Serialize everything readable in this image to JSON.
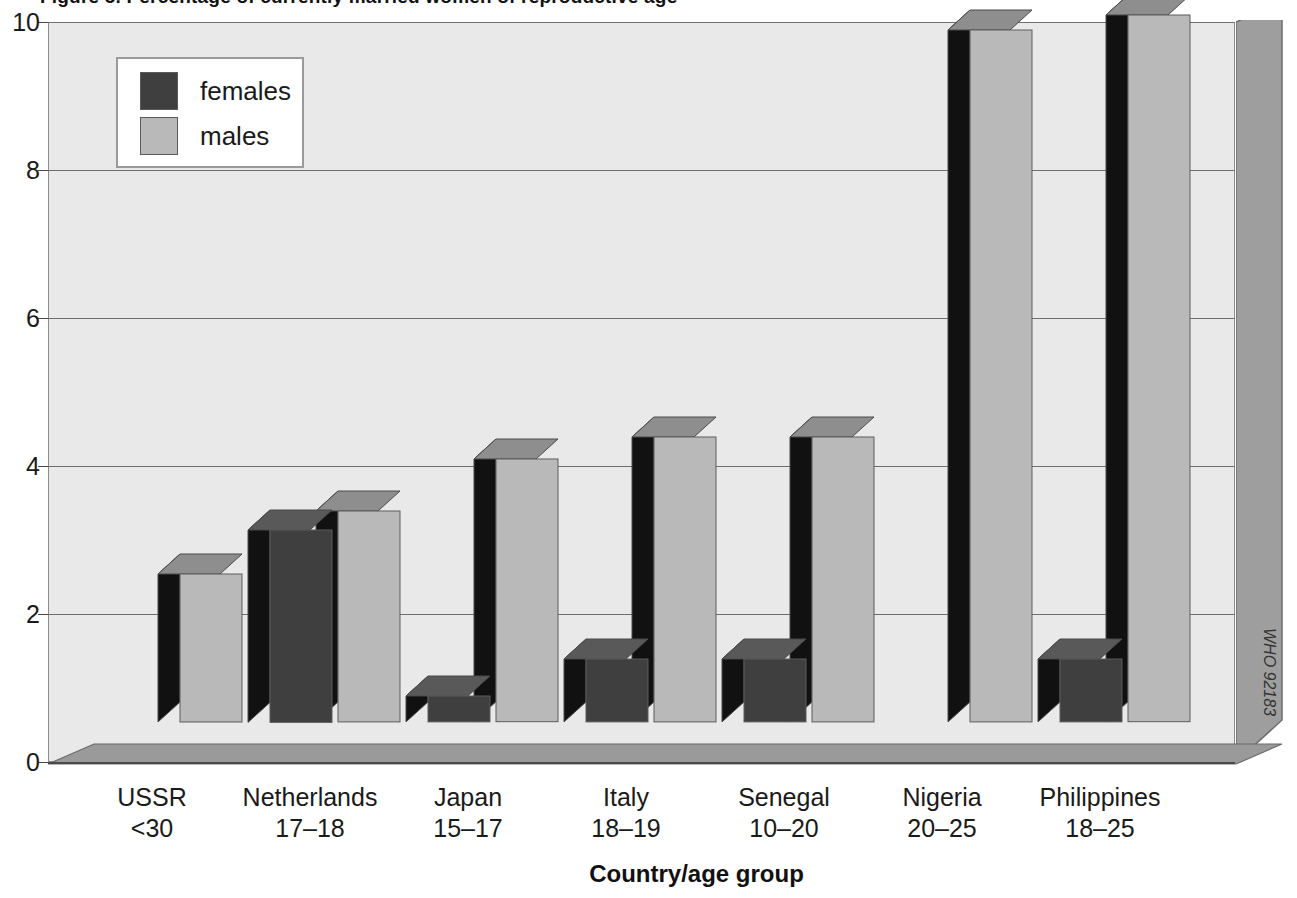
{
  "title_cut": "Figure 5. Percentage of currently married women of reproductive age",
  "credit": "WHO 92183",
  "legend": {
    "position": "top-left",
    "entries": [
      {
        "label": "females",
        "color": "#3f3f3f",
        "key": "females"
      },
      {
        "label": "males",
        "color": "#b9b9b9",
        "key": "males"
      }
    ]
  },
  "chart_data": {
    "type": "bar",
    "title": "",
    "xlabel": "Country/age group",
    "ylabel": "",
    "ylim": [
      0,
      10
    ],
    "yticks": [
      0,
      2,
      4,
      6,
      8,
      10
    ],
    "ytick_labels": [
      "0",
      "2",
      "4",
      "6",
      "8",
      "10"
    ],
    "grid": true,
    "legend_position": "top-left",
    "style": "3d-clustered-bar",
    "categories": [
      "USSR\n<30",
      "Netherlands\n17–18",
      "Japan\n15–17",
      "Italy\n18–19",
      "Senegal\n10–20",
      "Nigeria\n20–25",
      "Philippines\n18–25"
    ],
    "category_country": [
      "USSR",
      "Netherlands",
      "Japan",
      "Italy",
      "Senegal",
      "Nigeria",
      "Philippines"
    ],
    "category_age": [
      "<30",
      "17–18",
      "15–17",
      "18–19",
      "10–20",
      "20–25",
      "18–25"
    ],
    "series": [
      {
        "name": "females",
        "color": "#3f3f3f",
        "values": [
          0,
          2.6,
          0.35,
          0.85,
          0.85,
          0,
          0.85
        ]
      },
      {
        "name": "males",
        "color": "#b9b9b9",
        "values": [
          2.0,
          2.85,
          3.55,
          3.85,
          3.85,
          9.35,
          9.55
        ]
      }
    ]
  },
  "colors": {
    "plot_background": "#e9e9e9",
    "page_background": "#ffffff",
    "female_bar": "#3f3f3f",
    "female_bar_top": "#595959",
    "female_bar_side": "#111111",
    "male_bar": "#b9b9b9",
    "male_bar_top": "#8e8e8e",
    "male_bar_side": "#111111",
    "gridline": "#6e6e6e",
    "floor": "#9a9a9a",
    "wall": "#8c8c8c",
    "text": "#1a1a1a"
  }
}
